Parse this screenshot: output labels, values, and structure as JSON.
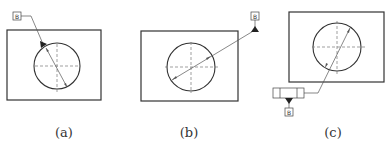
{
  "figures": [
    {
      "id": "a",
      "caption": "(a)",
      "datum_label": "B",
      "datum_placement": "datum triangle attached to circle edge, leader to datum label"
    },
    {
      "id": "b",
      "caption": "(b)",
      "datum_label": "B",
      "datum_placement": "datum triangle on leader extension from diameter dimension"
    },
    {
      "id": "c",
      "caption": "(c)",
      "datum_label": "B",
      "datum_placement": "datum triangle attached below feature control frame"
    }
  ],
  "colors": {
    "stroke": "#333333",
    "thin": "#555555",
    "centerline": "#777777",
    "background": "#ffffff"
  }
}
